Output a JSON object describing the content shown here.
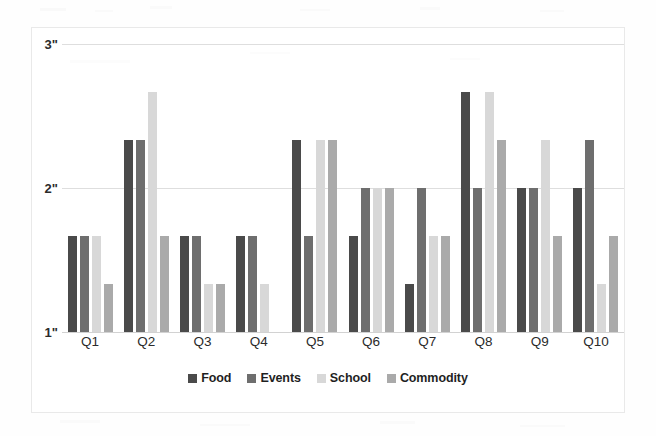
{
  "chart_data": {
    "type": "bar",
    "title": "",
    "subtitle": "",
    "xlabel": "",
    "ylabel": "",
    "categories": [
      "Q1",
      "Q2",
      "Q3",
      "Q4",
      "Q5",
      "Q6",
      "Q7",
      "Q8",
      "Q9",
      "Q10"
    ],
    "ylim": [
      1,
      3
    ],
    "yticks": [
      1,
      2,
      3
    ],
    "ytick_labels": [
      "1\"",
      "2\"",
      "3\""
    ],
    "grid": true,
    "legend_position": "bottom",
    "series": [
      {
        "name": "Food",
        "color": "#4a4a4a",
        "values": [
          1.67,
          2.33,
          1.67,
          1.67,
          2.33,
          1.67,
          1.33,
          2.67,
          2.0,
          2.0
        ]
      },
      {
        "name": "Events",
        "color": "#6e6e6e",
        "values": [
          1.67,
          2.33,
          1.67,
          1.67,
          1.67,
          2.0,
          2.0,
          2.0,
          2.0,
          2.33
        ]
      },
      {
        "name": "School",
        "color": "#d8d8d8",
        "values": [
          1.67,
          2.67,
          1.33,
          1.33,
          2.33,
          2.0,
          1.67,
          2.67,
          2.33,
          1.33
        ]
      },
      {
        "name": "Commodity",
        "color": "#aaaaaa",
        "values": [
          1.33,
          1.67,
          1.33,
          1.0,
          2.33,
          2.0,
          1.67,
          2.33,
          1.67,
          1.67
        ]
      }
    ]
  },
  "legend": {
    "items": [
      {
        "label": "Food",
        "color": "#4a4a4a"
      },
      {
        "label": "Events",
        "color": "#6e6e6e"
      },
      {
        "label": "School",
        "color": "#d8d8d8"
      },
      {
        "label": "Commodity",
        "color": "#aaaaaa"
      }
    ]
  },
  "axis": {
    "y_labels": [
      "3\"",
      "2\"",
      "1\""
    ],
    "x_labels": [
      "Q1",
      "Q2",
      "Q3",
      "Q4",
      "Q5",
      "Q6",
      "Q7",
      "Q8",
      "Q9",
      "Q10"
    ]
  }
}
